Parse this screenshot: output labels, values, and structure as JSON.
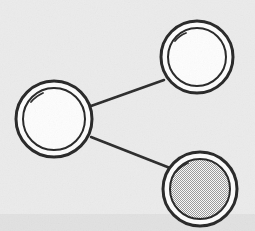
{
  "figure": {
    "width": 255,
    "height": 231,
    "style": "hand-drawn line art",
    "background_color": "#ebebeb",
    "ink_color": "#262626"
  },
  "nodes": [
    {
      "id": "node-left",
      "label": "left node",
      "cx": 54,
      "cy": 119,
      "outer_radius": 38,
      "inner_radius": 31,
      "fill": "white",
      "fill_color": "#fdfdfd"
    },
    {
      "id": "node-top-right",
      "label": "top right node",
      "cx": 197,
      "cy": 57,
      "outer_radius": 36,
      "inner_radius": 29,
      "fill": "white",
      "fill_color": "#fdfdfd"
    },
    {
      "id": "node-bottom-right",
      "label": "bottom right node",
      "cx": 200,
      "cy": 189,
      "outer_radius": 37,
      "inner_radius": 30,
      "fill": "stipple",
      "fill_color": "#b4b4b4"
    }
  ],
  "edges": [
    {
      "id": "edge-left-to-top-right",
      "from": "node-left",
      "to": "node-top-right",
      "x1": 91,
      "y1": 106,
      "x2": 164,
      "y2": 80
    },
    {
      "id": "edge-left-to-bottom-right",
      "from": "node-left",
      "to": "node-bottom-right",
      "x1": 91,
      "y1": 137,
      "x2": 170,
      "y2": 168
    }
  ]
}
